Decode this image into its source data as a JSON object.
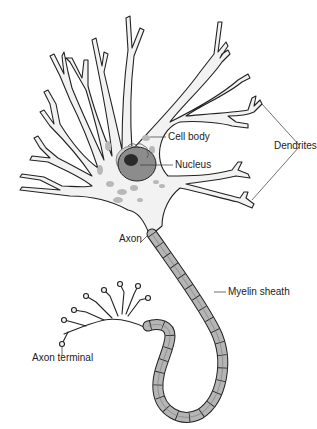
{
  "diagram": {
    "labels": {
      "cell_body": "Cell body",
      "nucleus": "Nucleus",
      "dendrites": "Dendrites",
      "axon": "Axon",
      "myelin_sheath": "Myelin sheath",
      "axon_terminal": "Axon terminal"
    },
    "colors": {
      "background": "#ffffff",
      "cell_fill": "#f2f2f2",
      "outline": "#222222",
      "nucleus_fill": "#8c8c8c",
      "nucleolus_fill": "#2a2a2a",
      "myelin_fill": "#b5b5b5",
      "organelle_fill": "#b8b8b8"
    }
  }
}
